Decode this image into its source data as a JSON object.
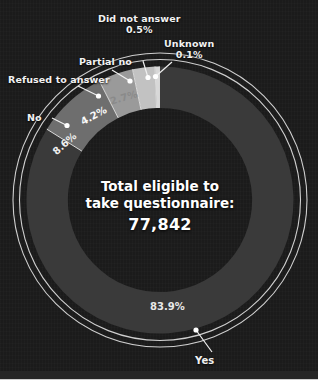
{
  "figure": {
    "center_line1": "Total eligible to",
    "center_line2": "take questionnaire:",
    "center_value": "77,842",
    "background_color": "#1b1b1b"
  },
  "labels": {
    "refused": "Refused to answer",
    "no": "No",
    "partial_no": "Partial no",
    "did_not_answer": "Did not answer",
    "did_not_answer_pct": "0.5%",
    "unknown": "Unknown",
    "unknown_pct": "0.1%",
    "yes": "Yes",
    "pct_no": "8.6%",
    "pct_refused": "4.2%",
    "pct_partial_no": "2.7%",
    "pct_yes": "83.9%"
  },
  "chart_data": {
    "type": "pie",
    "title": "Total eligible to take questionnaire: 77,842",
    "subtitle": "",
    "xlabel": "",
    "ylabel": "",
    "units": "percent",
    "total_label": "Total eligible to take questionnaire:",
    "total_value": 77842,
    "legend_position": "callout-labels",
    "grid": false,
    "hole_ratio": 0.69,
    "start_angle_deg": 0,
    "direction": "counterclockwise",
    "categories": [
      "Yes",
      "No",
      "Refused to answer",
      "Partial no",
      "Did not answer",
      "Unknown"
    ],
    "values": [
      83.9,
      8.6,
      4.2,
      2.7,
      0.5,
      0.1
    ],
    "value_labels": [
      "83.9%",
      "8.6%",
      "4.2%",
      "2.7%",
      "0.5%",
      "0.1%"
    ],
    "colors": [
      "#3a3a3a",
      "#6e6e6e",
      "#9a9a9a",
      "#c2c2c2",
      "#d8d8d8",
      "#f4f4f4"
    ],
    "segments": [
      {
        "name": "Unknown",
        "value": 0.1,
        "label": "0.1%",
        "color": "#f4f4f4"
      },
      {
        "name": "Did not answer",
        "value": 0.5,
        "label": "0.5%",
        "color": "#d8d8d8"
      },
      {
        "name": "Partial no",
        "value": 2.7,
        "label": "2.7%",
        "color": "#c2c2c2"
      },
      {
        "name": "Refused to answer",
        "value": 4.2,
        "label": "4.2%",
        "color": "#9a9a9a"
      },
      {
        "name": "No",
        "value": 8.6,
        "label": "8.6%",
        "color": "#6e6e6e"
      },
      {
        "name": "Yes",
        "value": 83.9,
        "label": "83.9%",
        "color": "#3a3a3a"
      }
    ]
  }
}
